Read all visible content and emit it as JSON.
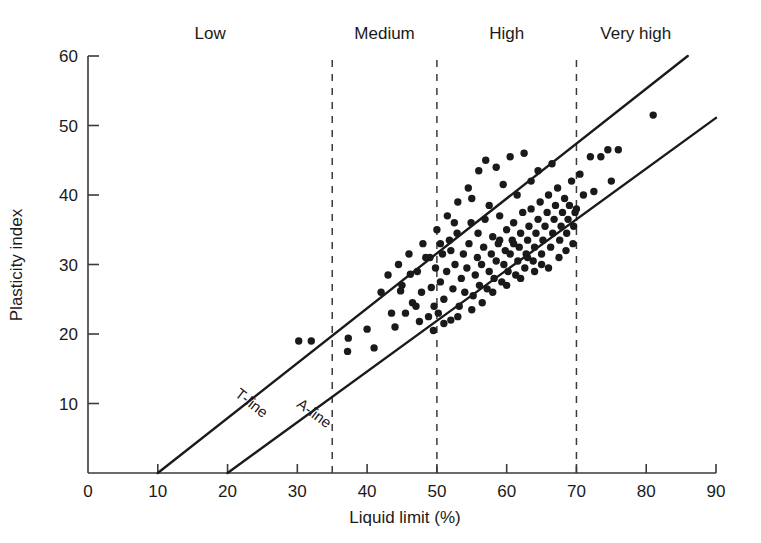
{
  "chart_data": {
    "type": "scatter",
    "title": "",
    "xlabel": "Liquid limit (%)",
    "ylabel": "Plasticity index",
    "xlim": [
      0,
      90
    ],
    "ylim": [
      0,
      60
    ],
    "xticks": [
      0,
      10,
      20,
      30,
      40,
      50,
      60,
      70,
      80,
      90
    ],
    "yticks": [
      0,
      10,
      20,
      30,
      40,
      50,
      60
    ],
    "grid": false,
    "legend": "none",
    "zones": [
      {
        "label": "Low",
        "x_center": 17.5,
        "x_start": 0,
        "x_end": 35
      },
      {
        "label": "Medium",
        "x_center": 42.5,
        "x_start": 35,
        "x_end": 50
      },
      {
        "label": "High",
        "x_center": 60.0,
        "x_start": 50,
        "x_end": 70
      },
      {
        "label": "Very high",
        "x_center": 78.5,
        "x_start": 70,
        "x_end": 90
      }
    ],
    "zone_boundaries": [
      35,
      50,
      70
    ],
    "reference_lines": [
      {
        "name": "T-line",
        "x_intercept": 10,
        "slope": 0.79,
        "label": "T-line",
        "label_x": 23,
        "label_y": 9.5
      },
      {
        "name": "A-line",
        "x_intercept": 20,
        "slope": 0.73,
        "label": "A-line",
        "label_x": 32,
        "label_y": 8.0
      }
    ],
    "series": [
      {
        "name": "Soil samples",
        "marker": "filled-circle",
        "color": "#1a1a1a",
        "points": [
          [
            30.2,
            19.0
          ],
          [
            32.0,
            19.0
          ],
          [
            37.3,
            19.4
          ],
          [
            37.2,
            17.5
          ],
          [
            40.0,
            20.7
          ],
          [
            41.0,
            18.0
          ],
          [
            43.5,
            23.0
          ],
          [
            44.0,
            21.0
          ],
          [
            44.8,
            26.2
          ],
          [
            45.5,
            23.0
          ],
          [
            46.2,
            28.6
          ],
          [
            47.0,
            24.0
          ],
          [
            47.5,
            21.8
          ],
          [
            47.8,
            26.0
          ],
          [
            48.4,
            31.0
          ],
          [
            48.8,
            22.5
          ],
          [
            49.2,
            26.7
          ],
          [
            49.6,
            24.0
          ],
          [
            49.8,
            29.5
          ],
          [
            50.2,
            23.0
          ],
          [
            50.5,
            27.5
          ],
          [
            50.8,
            31.5
          ],
          [
            51.0,
            25.0
          ],
          [
            51.4,
            29.0
          ],
          [
            51.8,
            33.5
          ],
          [
            52.0,
            22.0
          ],
          [
            52.3,
            26.5
          ],
          [
            52.6,
            30.0
          ],
          [
            52.9,
            34.5
          ],
          [
            53.2,
            24.0
          ],
          [
            53.5,
            28.0
          ],
          [
            53.8,
            31.5
          ],
          [
            54.0,
            26.0
          ],
          [
            54.3,
            29.5
          ],
          [
            54.6,
            33.0
          ],
          [
            54.9,
            36.0
          ],
          [
            55.2,
            25.5
          ],
          [
            55.5,
            28.5
          ],
          [
            55.8,
            31.0
          ],
          [
            55.9,
            34.5
          ],
          [
            56.1,
            27.0
          ],
          [
            56.4,
            30.0
          ],
          [
            56.7,
            32.5
          ],
          [
            56.9,
            36.5
          ],
          [
            57.2,
            26.5
          ],
          [
            57.5,
            29.0
          ],
          [
            57.8,
            31.5
          ],
          [
            58.0,
            34.0
          ],
          [
            58.2,
            28.0
          ],
          [
            58.5,
            30.5
          ],
          [
            58.8,
            33.0
          ],
          [
            59.0,
            37.0
          ],
          [
            59.3,
            27.5
          ],
          [
            59.6,
            30.0
          ],
          [
            59.8,
            32.0
          ],
          [
            60.0,
            35.0
          ],
          [
            60.2,
            29.0
          ],
          [
            60.5,
            31.5
          ],
          [
            60.8,
            33.5
          ],
          [
            61.0,
            36.0
          ],
          [
            61.3,
            28.5
          ],
          [
            61.6,
            30.5
          ],
          [
            61.8,
            32.5
          ],
          [
            62.0,
            34.5
          ],
          [
            62.3,
            37.5
          ],
          [
            62.6,
            29.5
          ],
          [
            62.8,
            31.5
          ],
          [
            63.0,
            33.5
          ],
          [
            63.2,
            35.5
          ],
          [
            63.5,
            38.0
          ],
          [
            63.8,
            30.5
          ],
          [
            64.0,
            32.5
          ],
          [
            64.2,
            34.5
          ],
          [
            64.5,
            36.5
          ],
          [
            64.8,
            39.0
          ],
          [
            65.0,
            31.5
          ],
          [
            65.2,
            33.5
          ],
          [
            65.5,
            35.5
          ],
          [
            65.8,
            37.5
          ],
          [
            66.0,
            40.0
          ],
          [
            66.3,
            32.5
          ],
          [
            66.6,
            34.5
          ],
          [
            66.8,
            36.5
          ],
          [
            67.0,
            38.5
          ],
          [
            67.3,
            41.0
          ],
          [
            67.6,
            33.5
          ],
          [
            67.8,
            35.5
          ],
          [
            68.0,
            37.5
          ],
          [
            68.3,
            39.5
          ],
          [
            68.6,
            34.5
          ],
          [
            68.8,
            36.5
          ],
          [
            69.0,
            38.5
          ],
          [
            69.3,
            42.0
          ],
          [
            69.6,
            35.5
          ],
          [
            69.8,
            37.5
          ],
          [
            44.5,
            30.0
          ],
          [
            45.0,
            27.0
          ],
          [
            46.5,
            24.5
          ],
          [
            42.0,
            26.0
          ],
          [
            43.0,
            28.5
          ],
          [
            50.0,
            35.0
          ],
          [
            51.5,
            37.0
          ],
          [
            53.0,
            39.0
          ],
          [
            54.5,
            41.0
          ],
          [
            56.0,
            43.5
          ],
          [
            57.0,
            45.0
          ],
          [
            58.5,
            44.0
          ],
          [
            60.5,
            45.5
          ],
          [
            62.5,
            46.0
          ],
          [
            64.5,
            43.5
          ],
          [
            66.5,
            44.5
          ],
          [
            63.5,
            42.0
          ],
          [
            59.5,
            41.5
          ],
          [
            61.5,
            40.0
          ],
          [
            55.0,
            39.5
          ],
          [
            52.5,
            36.0
          ],
          [
            48.0,
            33.0
          ],
          [
            49.0,
            31.0
          ],
          [
            47.2,
            29.0
          ],
          [
            46.0,
            31.5
          ],
          [
            70.5,
            43.0
          ],
          [
            72.0,
            45.5
          ],
          [
            73.5,
            45.5
          ],
          [
            71.0,
            40.0
          ],
          [
            72.5,
            40.5
          ],
          [
            70.0,
            38.0
          ],
          [
            74.5,
            46.5
          ],
          [
            76.0,
            46.5
          ],
          [
            75.0,
            42.0
          ],
          [
            81.0,
            51.5
          ],
          [
            65.0,
            30.0
          ],
          [
            66.0,
            29.5
          ],
          [
            64.0,
            29.0
          ],
          [
            62.0,
            28.0
          ],
          [
            60.0,
            27.0
          ],
          [
            58.0,
            26.0
          ],
          [
            56.5,
            24.5
          ],
          [
            55.0,
            23.5
          ],
          [
            53.0,
            22.5
          ],
          [
            51.0,
            21.5
          ],
          [
            49.5,
            20.5
          ],
          [
            67.5,
            31.0
          ],
          [
            68.5,
            32.0
          ],
          [
            69.5,
            33.0
          ],
          [
            57.5,
            38.5
          ],
          [
            59.0,
            33.5
          ],
          [
            61.0,
            33.0
          ],
          [
            63.0,
            31.0
          ],
          [
            50.5,
            33.0
          ],
          [
            52.0,
            32.0
          ]
        ]
      }
    ]
  },
  "axes": {
    "x_axis_name": "liquid-limit-axis",
    "y_axis_name": "plasticity-index-axis"
  }
}
